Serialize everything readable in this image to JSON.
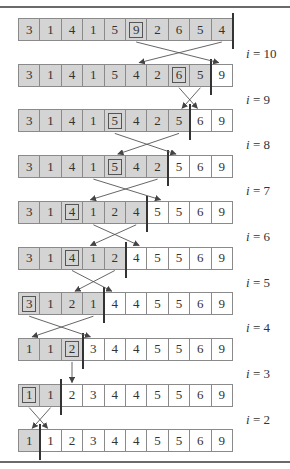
{
  "figure": {
    "rows": [
      {
        "values": [
          3,
          1,
          4,
          1,
          5,
          9,
          2,
          6,
          5,
          4
        ],
        "heap_size": 10,
        "boxed": 5
      },
      {
        "values": [
          3,
          1,
          4,
          1,
          5,
          4,
          2,
          6,
          5,
          9
        ],
        "heap_size": 9,
        "boxed": 7
      },
      {
        "values": [
          3,
          1,
          4,
          1,
          5,
          4,
          2,
          5,
          6,
          9
        ],
        "heap_size": 8,
        "boxed": 4
      },
      {
        "values": [
          3,
          1,
          4,
          1,
          5,
          4,
          2,
          5,
          6,
          9
        ],
        "heap_size": 7,
        "boxed": 4
      },
      {
        "values": [
          3,
          1,
          4,
          1,
          2,
          4,
          5,
          5,
          6,
          9
        ],
        "heap_size": 6,
        "boxed": 2
      },
      {
        "values": [
          3,
          1,
          4,
          1,
          2,
          4,
          5,
          5,
          6,
          9
        ],
        "heap_size": 5,
        "boxed": 2
      },
      {
        "values": [
          3,
          1,
          2,
          1,
          4,
          4,
          5,
          5,
          6,
          9
        ],
        "heap_size": 4,
        "boxed": 0
      },
      {
        "values": [
          1,
          1,
          2,
          3,
          4,
          4,
          5,
          5,
          6,
          9
        ],
        "heap_size": 3,
        "boxed": 2
      },
      {
        "values": [
          1,
          1,
          2,
          3,
          4,
          4,
          5,
          5,
          6,
          9
        ],
        "heap_size": 2,
        "boxed": 0
      },
      {
        "values": [
          1,
          1,
          2,
          3,
          4,
          4,
          5,
          5,
          6,
          9
        ],
        "heap_size": 1,
        "boxed": null
      }
    ],
    "labels": [
      "i = 10",
      "i = 9",
      "i = 8",
      "i = 7",
      "i = 6",
      "i = 5",
      "i = 4",
      "i = 3",
      "i = 2"
    ],
    "swaps": [
      {
        "from_row": 0,
        "a": 5,
        "b": 9
      },
      {
        "from_row": 1,
        "a": 7,
        "b": 8
      },
      {
        "from_row": 2,
        "a": 4,
        "b": 7
      },
      {
        "from_row": 3,
        "a": 6,
        "b": 3
      },
      {
        "from_row": 4,
        "a": 5,
        "b": 3
      },
      {
        "from_row": 5,
        "a": 2,
        "b": 4
      },
      {
        "from_row": 6,
        "a": 0,
        "b": 3
      },
      {
        "from_row": 7,
        "a": 2,
        "b": 2
      },
      {
        "from_row": 8,
        "a": 0,
        "b": 1
      }
    ],
    "colors": {
      "heap": "#d4d4d4",
      "sorted": "#ffffff",
      "line": "#333333",
      "rule": "#6a6a6a"
    }
  }
}
